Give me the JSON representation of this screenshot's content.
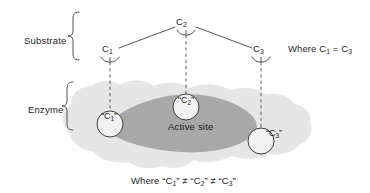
{
  "figure": {
    "colors": {
      "enzyme_body": "#e6e6e6",
      "active_site": "#a8a8a8",
      "stroke": "#4a4a4a",
      "text": "#1c1c1c",
      "circle_fill": "#f2f2f2"
    }
  },
  "brackets": {
    "substrate_label": "Substrate",
    "enzyme_label": "Enzyme"
  },
  "substrate": {
    "nodes": [
      {
        "id": "c1",
        "label": "C",
        "sub": "1"
      },
      {
        "id": "c2",
        "label": "C",
        "sub": "2"
      },
      {
        "id": "c3",
        "label": "C",
        "sub": "3"
      }
    ]
  },
  "enzyme": {
    "active_site_label": "Active site",
    "sites": [
      {
        "id": "ec1",
        "open_quote": "“",
        "label": "C",
        "sub": "1",
        "close_quote": "”"
      },
      {
        "id": "ec2",
        "open_quote": "“",
        "label": "C",
        "sub": "2",
        "close_quote": "”"
      },
      {
        "id": "ec3",
        "open_quote": "“",
        "label": "C",
        "sub": "3",
        "close_quote": "”"
      }
    ]
  },
  "annotations": {
    "top_right_note": {
      "prefix": "Where C",
      "sub1": "1",
      "operator": " = C",
      "sub2": "3"
    },
    "bottom_caption": {
      "prefix": "Where “C",
      "sub1": "1",
      "mid1": "” ≠ “C",
      "sub2": "2",
      "mid2": "” ≠ “C",
      "sub3": "3",
      "suffix": "”"
    }
  }
}
